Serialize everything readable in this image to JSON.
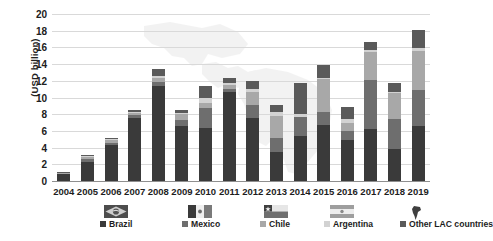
{
  "chart_data": {
    "type": "bar",
    "subtype": "stacked-bar",
    "title": "",
    "xlabel": "",
    "ylabel": "(USD billion)",
    "ylim": [
      0,
      20
    ],
    "ytick_step": 2,
    "yticks": [
      "20",
      "18",
      "16",
      "14",
      "12",
      "10",
      "8",
      "6",
      "4",
      "2",
      "0"
    ],
    "grid": true,
    "legend_position": "bottom",
    "categories": [
      "2004",
      "2005",
      "2006",
      "2007",
      "2008",
      "2009",
      "2010",
      "2011",
      "2012",
      "2013",
      "2014",
      "2015",
      "2016",
      "2017",
      "2018",
      "2019"
    ],
    "series": [
      {
        "name": "Brazil",
        "color": "#3a3a3a",
        "values": [
          0.8,
          2.3,
          4.3,
          7.6,
          11.4,
          6.6,
          6.4,
          10.7,
          7.6,
          3.5,
          5.4,
          6.7,
          4.9,
          6.2,
          3.8,
          6.6
        ]
      },
      {
        "name": "Mexico",
        "color": "#6e6e6e",
        "values": [
          0.1,
          0.3,
          0.2,
          0.3,
          0.4,
          0.7,
          2.3,
          0.3,
          1.5,
          1.7,
          2.3,
          1.6,
          1.1,
          5.9,
          3.6,
          4.3
        ]
      },
      {
        "name": "Chile",
        "color": "#a8a8a8",
        "values": [
          0.1,
          0.3,
          0.4,
          0.3,
          0.5,
          0.7,
          0.7,
          0.5,
          1.6,
          2.6,
          0.0,
          3.9,
          0.9,
          3.4,
          3.1,
          4.7
        ]
      },
      {
        "name": "Argentina",
        "color": "#d2d2d2",
        "values": [
          0.0,
          0.1,
          0.1,
          0.1,
          0.3,
          0.2,
          0.5,
          0.2,
          0.3,
          0.5,
          0.3,
          0.1,
          0.5,
          0.2,
          0.2,
          0.3
        ]
      },
      {
        "name": "Other LAC countries",
        "color": "#5a5a5a",
        "values": [
          0.1,
          0.1,
          0.1,
          0.2,
          0.8,
          0.3,
          1.5,
          0.6,
          1.0,
          0.8,
          3.8,
          1.6,
          1.5,
          1.0,
          1.1,
          2.2
        ]
      }
    ],
    "totals": [
      1.1,
      3.1,
      5.1,
      8.5,
      13.4,
      8.5,
      11.4,
      12.3,
      12.0,
      9.1,
      11.8,
      13.9,
      8.9,
      16.7,
      11.8,
      18.1
    ]
  },
  "legend": {
    "items": [
      {
        "label": "Brazil",
        "color": "#3a3a3a",
        "flag": "brazil-flag-icon"
      },
      {
        "label": "Mexico",
        "color": "#6e6e6e",
        "flag": "mexico-flag-icon"
      },
      {
        "label": "Chile",
        "color": "#a8a8a8",
        "flag": "chile-flag-icon"
      },
      {
        "label": "Argentina",
        "color": "#d2d2d2",
        "flag": "argentina-flag-icon"
      },
      {
        "label": "Other LAC countries",
        "color": "#5a5a5a",
        "flag": "lac-region-icon"
      }
    ]
  }
}
